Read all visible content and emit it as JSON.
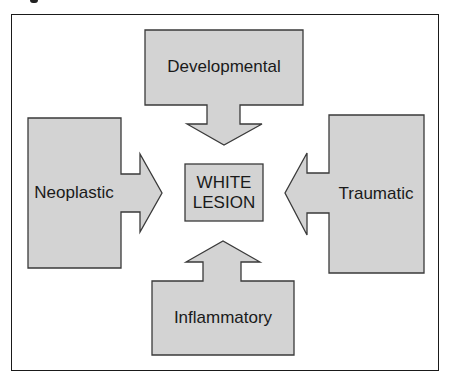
{
  "diagram": {
    "type": "cause-arrows-to-center",
    "center": {
      "line1": "WHITE",
      "line2": "LESION"
    },
    "causes": [
      {
        "position": "top",
        "label": "Developmental"
      },
      {
        "position": "left",
        "label": "Neoplastic"
      },
      {
        "position": "right",
        "label": "Traumatic"
      },
      {
        "position": "bottom",
        "label": "Inflammatory"
      }
    ],
    "colors": {
      "fill": "#d3d3d3",
      "stroke": "#3a3a3a",
      "frame": "#1a1a1a",
      "text": "#1a1a1a"
    }
  }
}
